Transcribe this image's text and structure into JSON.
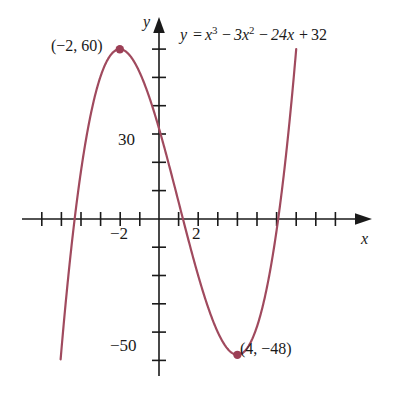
{
  "figure": {
    "background_color": "#ffffff",
    "curve_color": "#a04a5e",
    "axis_color": "#1a1a1a",
    "text_color": "#1a1a1a"
  },
  "equation": {
    "full_text": "y = x^3 - 3x^2 - 24x + 32",
    "y": "y",
    "equals": "=",
    "term_x3_base": "x",
    "term_x3_exp": "3",
    "minus_1": "−",
    "term_3x2_base": "3x",
    "term_3x2_exp": "2",
    "minus_2": "−",
    "term_24x": "24x",
    "plus": "+",
    "constant": "32"
  },
  "axes": {
    "x_axis_name": "x",
    "y_axis_name": "y",
    "x_tick_label": "−2",
    "x_tick_label_2": "2",
    "y_tick_label_30": "30",
    "y_tick_label_minus50": "−50"
  },
  "points": [
    {
      "label": "(−2, 60)",
      "x": -2,
      "y": 60,
      "name": "local-maximum"
    },
    {
      "label": "(4, −48)",
      "x": 4,
      "y": -48,
      "name": "local-minimum"
    }
  ],
  "chart_data": {
    "type": "line",
    "title": "",
    "subtitle": "",
    "xlabel": "x",
    "ylabel": "y",
    "equation": "y = x^3 - 3x^2 - 24x + 32",
    "function": "cubic",
    "coefficients": {
      "x3": 1,
      "x2": -3,
      "x1": -24,
      "x0": 32
    },
    "xlim": [
      -7,
      7.5
    ],
    "ylim": [
      -70,
      80
    ],
    "x_tick_step": 1,
    "y_tick_step": 10,
    "x_ticks_labeled": [
      -2,
      2
    ],
    "y_ticks_labeled": [
      30,
      -50
    ],
    "grid": false,
    "legend": "none",
    "annotations": [
      {
        "text": "(−2, 60)",
        "x": -2,
        "y": 60
      },
      {
        "text": "(4, −48)",
        "x": 4,
        "y": -48
      },
      {
        "text": "y = x^3 - 3x^2 - 24x + 32",
        "x": 1.2,
        "y": 72
      }
    ],
    "markers": [
      {
        "x": -2,
        "y": 60
      },
      {
        "x": 4,
        "y": -48
      }
    ],
    "x": [
      -6.5,
      -6.25,
      -6,
      -5.75,
      -5.5,
      -5.25,
      -5,
      -4.75,
      -4.5,
      -4.25,
      -4,
      -3.75,
      -3.5,
      -3.25,
      -3,
      -2.75,
      -2.5,
      -2.25,
      -2,
      -1.75,
      -1.5,
      -1.25,
      -1,
      -0.75,
      -0.5,
      -0.25,
      0,
      0.25,
      0.5,
      0.75,
      1,
      1.25,
      1.5,
      1.75,
      2,
      2.25,
      2.5,
      2.75,
      3,
      3.25,
      3.5,
      3.75,
      4,
      4.25,
      4.5,
      4.75,
      5,
      5.25,
      5.5,
      5.75,
      6,
      6.25,
      6.5
    ],
    "y": [
      -212.6,
      -186.0,
      -160.0,
      -135.0,
      -110.9,
      -87.8,
      -66.0,
      -45.3,
      -25.9,
      -7.8,
      9.0,
      24.5,
      38.6,
      51.3,
      62.0,
      71.5,
      78.1,
      83.4,
      86.0,
      87.2,
      86.6,
      84.5,
      80.0,
      74.9,
      67.5,
      59.6,
      50.0,
      40.4,
      29.3,
      18.4,
      6.0,
      -6.3,
      -19.9,
      -33.0,
      -48.0,
      -62.1,
      -77.8,
      -91.5,
      -107.0,
      -122.1,
      -136.6,
      -151.6,
      -168.0,
      -181.4,
      -195.1,
      -208.5,
      -223.0,
      -236.7,
      -250.3,
      -264.1,
      -278.0,
      -291.8,
      -305.6
    ]
  },
  "curve_path_note": "cubic y = x^3 - 3x^2 - 24x + 32 drawn over visible window"
}
